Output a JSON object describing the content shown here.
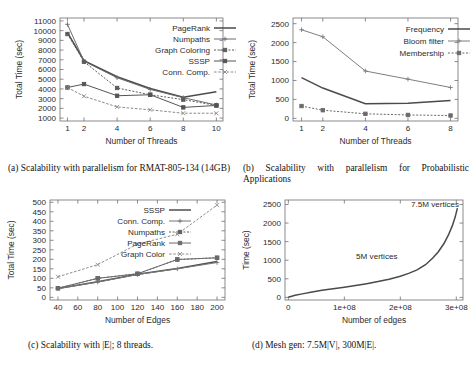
{
  "figure": {
    "panels": [
      "a",
      "b",
      "c",
      "d"
    ]
  },
  "captions": {
    "a_label": "(a)",
    "a_text": "Scalability with parallelism for RMAT-805-134 (14GB)",
    "b_label": "(b)",
    "b_text": "Scalability with parallelism for Probabilistic Applications",
    "c_label": "(c)",
    "c_text": "Scalability with |E|; 8 threads.",
    "d_label": "(d)",
    "d_text": "Mesh gen: 7.5M|V|, 300M|E|."
  },
  "chart_data": [
    {
      "id": "a",
      "type": "line",
      "title": "",
      "xlabel": "Number of Threads",
      "ylabel": "Total Time (sec)",
      "xlim": [
        0.55,
        10.4
      ],
      "ylim": [
        700,
        11300
      ],
      "xticks": [
        1,
        2,
        4,
        6,
        8,
        10
      ],
      "yticks": [
        1000,
        2000,
        3000,
        4000,
        5000,
        6000,
        7000,
        8000,
        9000,
        10000,
        11000
      ],
      "grid": false,
      "legend_position": "top-right",
      "x": [
        1,
        2,
        4,
        6,
        8,
        10
      ],
      "series": [
        {
          "name": "PageRank",
          "values": [
            9800,
            6900,
            5250,
            4050,
            3150,
            3700
          ],
          "color": "#4a4a4a",
          "marker": "none",
          "dash": "none"
        },
        {
          "name": "Numpaths",
          "values": [
            10650,
            6850,
            5150,
            3950,
            3100,
            2350
          ],
          "color": "#6d6d6d",
          "marker": "plus",
          "dash": "none"
        },
        {
          "name": "Graph Coloring",
          "values": [
            9650,
            6800,
            4100,
            3400,
            2900,
            2300
          ],
          "color": "#5c5c5c",
          "marker": "square",
          "dash": "2,1.6"
        },
        {
          "name": "SSSP",
          "values": [
            4150,
            4500,
            3300,
            3400,
            2100,
            2300
          ],
          "color": "#555555",
          "marker": "square",
          "dash": "none"
        },
        {
          "name": "Conn. Comp.",
          "values": [
            4150,
            3250,
            2150,
            1850,
            1500,
            1500
          ],
          "color": "#8a8a8a",
          "marker": "cross",
          "dash": "2.6,1.6"
        }
      ]
    },
    {
      "id": "b",
      "type": "line",
      "title": "",
      "xlabel": "Number of Threads",
      "ylabel": "Total Time (sec)",
      "xlim": [
        0.6,
        8.35
      ],
      "ylim": [
        -70,
        2650
      ],
      "xticks": [
        1,
        2,
        4,
        6,
        8
      ],
      "yticks": [
        0,
        500,
        1000,
        1500,
        2000,
        2500
      ],
      "grid": false,
      "legend_position": "top-right",
      "x": [
        1,
        2,
        4,
        6,
        8
      ],
      "series": [
        {
          "name": "Frequency",
          "values": [
            1075,
            800,
            385,
            400,
            470
          ],
          "color": "#4a4a4a",
          "marker": "none",
          "dash": "none"
        },
        {
          "name": "Bloom filter",
          "values": [
            2340,
            2155,
            1250,
            1035,
            815
          ],
          "color": "#7e7e7e",
          "marker": "plus",
          "dash": "none"
        },
        {
          "name": "Membership",
          "values": [
            325,
            215,
            120,
            90,
            75
          ],
          "color": "#6a6a6a",
          "marker": "square",
          "dash": "2,1.6"
        }
      ]
    },
    {
      "id": "c",
      "type": "line",
      "title": "",
      "xlabel": "Number of Edges",
      "ylabel": "Total Time (sec)",
      "xlim": [
        32,
        208
      ],
      "ylim": [
        -14,
        512
      ],
      "xticks": [
        40,
        60,
        80,
        100,
        120,
        140,
        160,
        180,
        200
      ],
      "yticks": [
        0,
        50,
        100,
        150,
        200,
        250,
        300,
        350,
        400,
        450,
        500
      ],
      "grid": false,
      "legend_position": "top-center",
      "x": [
        40,
        80,
        120,
        160,
        200
      ],
      "series": [
        {
          "name": "SSSP",
          "values": [
            46,
            82,
            122,
            152,
            188
          ],
          "color": "#4f4f4f",
          "marker": "none",
          "dash": "none"
        },
        {
          "name": "Conn. Comp.",
          "values": [
            46,
            80,
            120,
            150,
            183
          ],
          "color": "#777777",
          "marker": "plus",
          "dash": "none"
        },
        {
          "name": "Numpaths",
          "values": [
            48,
            100,
            124,
            199,
            208
          ],
          "color": "#5f5f5f",
          "marker": "square",
          "dash": "2,1.6"
        },
        {
          "name": "PageRank",
          "values": [
            48,
            100,
            124,
            199,
            208
          ],
          "color": "#6a6a6a",
          "marker": "square",
          "dash": "none"
        },
        {
          "name": "Graph Color",
          "values": [
            108,
            172,
            280,
            332,
            485
          ],
          "color": "#8d8d8d",
          "marker": "cross",
          "dash": "2.6,1.6"
        }
      ]
    },
    {
      "id": "d",
      "type": "line",
      "title": "",
      "xlabel": "Number of edges",
      "ylabel": "Time (sec)",
      "xlim": [
        -6000000,
        312000000
      ],
      "ylim": [
        -70,
        2620
      ],
      "xticks": [
        0,
        100000000,
        200000000,
        300000000
      ],
      "xticklabels": [
        "0",
        "1e+08",
        "2e+08",
        "3e+08"
      ],
      "yticks": [
        0,
        500,
        1000,
        1500,
        2000,
        2500
      ],
      "grid": false,
      "legend_position": "none",
      "annotations": [
        {
          "text": "7.5M vertices",
          "x": 262000000,
          "y": 2440
        },
        {
          "text": "5M vertices",
          "x": 158000000,
          "y": 1040
        }
      ],
      "series": [
        {
          "name": "mesh-generation",
          "color": "#4a4a4a",
          "marker": "none",
          "dash": "none",
          "x": [
            0,
            12000000,
            25000000,
            40000000,
            60000000,
            80000000,
            100000000,
            120000000,
            140000000,
            160000000,
            180000000,
            200000000,
            215000000,
            230000000,
            245000000,
            258000000,
            268000000,
            278000000,
            286000000,
            293000000,
            298000000,
            302000000
          ],
          "values": [
            5,
            55,
            95,
            140,
            190,
            235,
            275,
            320,
            370,
            425,
            490,
            570,
            645,
            740,
            880,
            1060,
            1230,
            1450,
            1680,
            1930,
            2160,
            2400
          ]
        }
      ]
    }
  ]
}
